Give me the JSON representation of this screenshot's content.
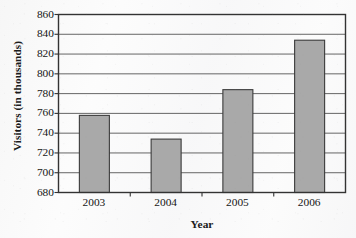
{
  "chart_data": {
    "type": "bar",
    "title": "",
    "subtitle": "",
    "xlabel": "Year",
    "ylabel": "Visitors (in thousands)",
    "categories": [
      "2003",
      "2004",
      "2005",
      "2006"
    ],
    "values": [
      758,
      734,
      784,
      834
    ],
    "series": [
      {
        "name": "Visitors",
        "values": [
          758,
          734,
          784,
          834
        ]
      }
    ],
    "ylim": [
      680,
      860
    ],
    "ytick_step": 20,
    "yticks": [
      680,
      700,
      720,
      740,
      760,
      780,
      800,
      820,
      840,
      860
    ],
    "xtick_labels": [
      "2003",
      "2004",
      "2005",
      "2006"
    ],
    "grid": true,
    "grid_axis": "y",
    "legend": false,
    "legend_position": "none",
    "bar_fill_color": "#a9a9a9",
    "bar_edge_color": "#3a3a3a",
    "gridline_color": "#555555",
    "axis_color": "#333333",
    "background_color": "#fbfbfb",
    "text_color": "#161616"
  },
  "axes": {
    "y_title": "Visitors (in thousands)",
    "x_title": "Year"
  }
}
